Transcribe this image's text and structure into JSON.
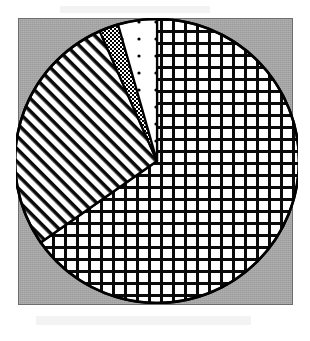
{
  "figure": {
    "title": "",
    "panel_background_color": "#a8a8a8",
    "panel_border_color": "#6e6e6e",
    "page_background_color": "#ffffff",
    "ink_color": "#000000"
  },
  "chart_data": {
    "type": "pie",
    "title": "",
    "subtitle": "",
    "xlabel": "",
    "ylabel": "",
    "grid": false,
    "legend": "none",
    "start_angle_deg": 90,
    "direction": "clockwise",
    "categories": [
      "Segment 1",
      "Segment 2",
      "Segment 3",
      "Segment 4"
    ],
    "values": [
      65.3,
      28.1,
      2.2,
      4.4
    ],
    "units": "percent",
    "slices": [
      {
        "label": "Segment 1",
        "value": 65.3,
        "start_deg": 0.0,
        "end_deg": 235.0,
        "fill_pattern": "cross-hatch",
        "fill_color": "#000000"
      },
      {
        "label": "Segment 2",
        "value": 28.1,
        "start_deg": 235.0,
        "end_deg": 336.2,
        "fill_pattern": "diagonal-hatch",
        "fill_color": "#000000"
      },
      {
        "label": "Segment 3",
        "value": 2.2,
        "start_deg": 336.2,
        "end_deg": 344.1,
        "fill_pattern": "dense-checker",
        "fill_color": "#000000"
      },
      {
        "label": "Segment 4",
        "value": 4.4,
        "start_deg": 344.1,
        "end_deg": 360.0,
        "fill_pattern": "sparse-dots",
        "fill_color": "#000000"
      }
    ],
    "annotations": [],
    "tick_labels": [],
    "data_labels": []
  }
}
